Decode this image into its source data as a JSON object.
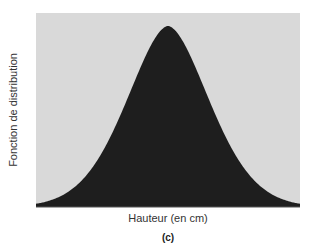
{
  "chart_data": {
    "type": "area",
    "title": "",
    "xlabel": "Hauteur (en cm)",
    "ylabel": "Fonction de distribution",
    "caption": "(c)",
    "grid": false,
    "legend": null,
    "x": [
      0,
      0.1,
      0.2,
      0.3,
      0.35,
      0.4,
      0.45,
      0.5,
      0.55,
      0.6,
      0.65,
      0.7,
      0.8,
      0.9,
      1.0
    ],
    "values": [
      0.01,
      0.04,
      0.12,
      0.3,
      0.46,
      0.66,
      0.87,
      1.0,
      0.87,
      0.66,
      0.46,
      0.3,
      0.12,
      0.04,
      0.01
    ],
    "colors": {
      "fill": "#1e1e1e",
      "background": "#d9d9d9"
    }
  }
}
